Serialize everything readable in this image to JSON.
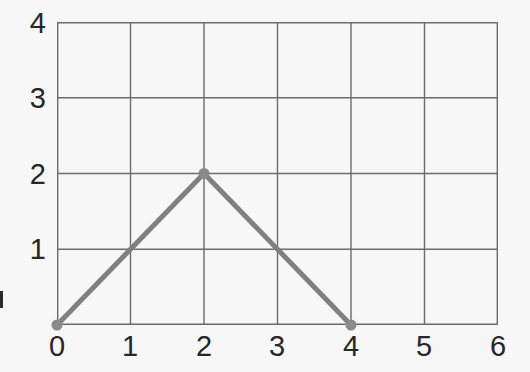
{
  "chart_data": {
    "type": "line",
    "title": "",
    "xlabel": "",
    "ylabel": "",
    "xlim": [
      0,
      6
    ],
    "ylim": [
      0,
      4
    ],
    "grid": true,
    "legend": null,
    "x": [
      0,
      2,
      4
    ],
    "y": [
      0,
      2,
      0
    ],
    "points": [
      {
        "x": 0,
        "y": 0
      },
      {
        "x": 2,
        "y": 2
      },
      {
        "x": 4,
        "y": 0
      }
    ],
    "series": [
      {
        "name": "triangle",
        "x": [
          0,
          2,
          4
        ],
        "values": [
          0,
          2,
          0
        ],
        "color": "#808080",
        "marker": "circle",
        "linewidth": 4
      }
    ],
    "xticks": [
      0,
      1,
      2,
      3,
      4,
      5,
      6
    ],
    "yticks": [
      0,
      1,
      2,
      3,
      4
    ],
    "xticklabels": [
      "0",
      "1",
      "2",
      "3",
      "4",
      "5",
      "6"
    ],
    "yticklabels": [
      "0",
      "1",
      "2",
      "3",
      "4"
    ],
    "yticklabels_visible": [
      "1",
      "2",
      "3",
      "4"
    ]
  },
  "axes": {
    "x_labels": [
      "0",
      "1",
      "2",
      "3",
      "4",
      "5",
      "6"
    ],
    "y_labels": [
      "4",
      "3",
      "2",
      "1"
    ]
  },
  "colors": {
    "background": "#f7f7f7",
    "grid": "#6b6b6b",
    "frame": "#555555",
    "data_line": "#808080",
    "marker": "#8a8a8a",
    "tick_text": "#262626"
  }
}
